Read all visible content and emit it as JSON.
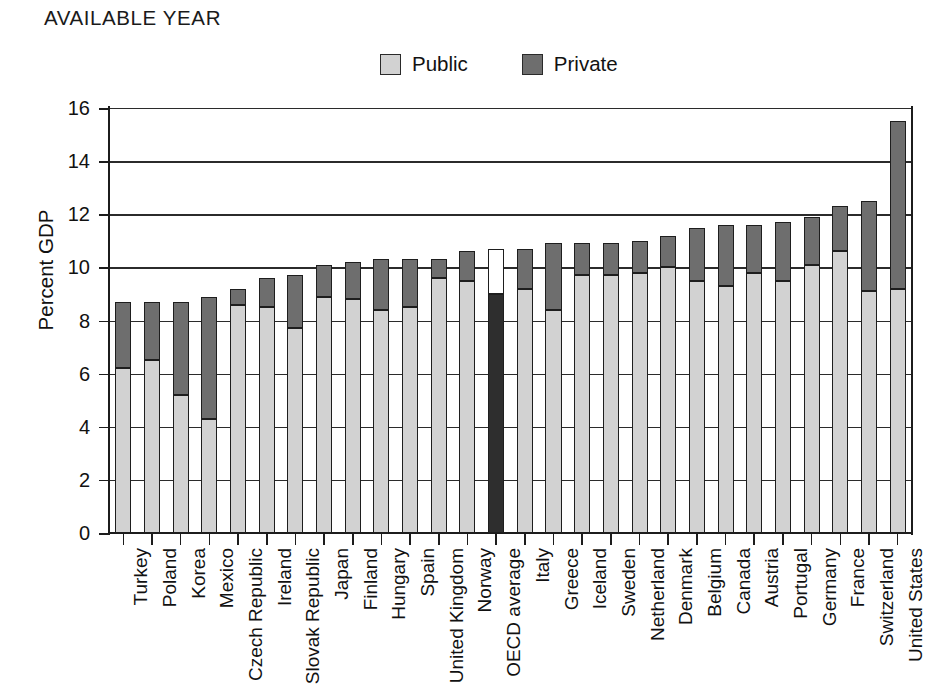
{
  "title": "AVAILABLE YEAR",
  "legend": {
    "position": "top-center",
    "entries": [
      {
        "label": "Public",
        "color": "#d2d2d2",
        "name": "public"
      },
      {
        "label": "Private",
        "color": "#6e6e6e",
        "name": "private"
      }
    ]
  },
  "chart_data": {
    "type": "bar",
    "subtype": "stacked-vertical",
    "title": "AVAILABLE YEAR",
    "xlabel": "",
    "ylabel": "Percent GDP",
    "ylim": [
      0,
      16
    ],
    "yticks": [
      0,
      2,
      4,
      6,
      8,
      10,
      12,
      14,
      16
    ],
    "ytick_labels": [
      "0",
      "2",
      "4",
      "6",
      "8",
      "10",
      "12",
      "14",
      "16"
    ],
    "grid": true,
    "grid_axis": "y",
    "categories": [
      "Turkey",
      "Poland",
      "Korea",
      "Mexico",
      "Czech Republic",
      "Ireland",
      "Slovak Republic",
      "Japan",
      "Finland",
      "Hungary",
      "Spain",
      "United Kingdom",
      "Norway",
      "OECD average",
      "Italy",
      "Greece",
      "Iceland",
      "Sweden",
      "Netherland",
      "Denmark",
      "Belgium",
      "Canada",
      "Austria",
      "Portugal",
      "Germany",
      "France",
      "Switzerland",
      "United States"
    ],
    "series": [
      {
        "name": "Public",
        "color": "#d2d2d2",
        "values": [
          6.2,
          6.5,
          5.2,
          4.3,
          8.6,
          8.5,
          7.7,
          8.9,
          8.8,
          8.4,
          8.5,
          9.6,
          9.5,
          9.0,
          9.2,
          8.4,
          9.7,
          9.7,
          9.8,
          10.0,
          9.5,
          9.3,
          9.8,
          9.5,
          10.1,
          10.6,
          9.1,
          9.2
        ]
      },
      {
        "name": "Private",
        "color": "#6e6e6e",
        "values": [
          2.5,
          2.2,
          3.5,
          4.6,
          0.6,
          1.1,
          2.0,
          1.2,
          1.4,
          1.9,
          1.8,
          0.7,
          1.1,
          1.7,
          1.5,
          2.5,
          1.2,
          1.2,
          1.2,
          1.2,
          2.0,
          2.3,
          1.8,
          2.2,
          1.8,
          1.7,
          3.4,
          6.3
        ]
      }
    ],
    "totals": [
      8.7,
      8.7,
      8.7,
      8.9,
      9.2,
      9.6,
      9.7,
      10.1,
      10.2,
      10.3,
      10.3,
      10.3,
      10.6,
      10.7,
      10.7,
      10.9,
      10.9,
      10.9,
      11.0,
      11.2,
      11.5,
      11.6,
      11.6,
      11.7,
      11.9,
      12.3,
      12.5,
      15.5
    ],
    "highlight_category": "OECD average",
    "highlight_colors": {
      "public": "#2e2e2e",
      "private": "#ffffff"
    }
  }
}
